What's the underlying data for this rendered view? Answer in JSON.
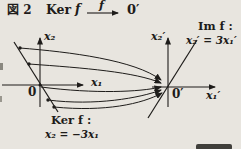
{
  "colors": {
    "paper": "#e8e5df",
    "ink": "#1e1c1a"
  },
  "title": {
    "figure_label": "図 2",
    "kernel_word": "Ker",
    "function_label": "f",
    "codomain_label": "0′"
  },
  "left_plot": {
    "y_axis_label": "x₂",
    "x_axis_label": "x₁",
    "origin_label": "0",
    "kernel_caption_line1": "Ker f :",
    "kernel_caption_line2": "x₂ = −3x₁"
  },
  "right_plot": {
    "y_axis_label": "x₂′",
    "x_axis_label": "x₁′",
    "origin_label": "0′",
    "image_caption_line1": "Im f :",
    "image_caption_line2": "x₂′ = 3x₁′"
  }
}
